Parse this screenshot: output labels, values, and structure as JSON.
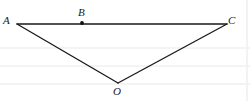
{
  "figure": {
    "kind": "geometry-diagram",
    "background_color": "#ffffff",
    "rule_line_color": "#f0f0f0",
    "stroke_color": "#1a1a1a",
    "points": [
      {
        "id": "A",
        "label": "A",
        "x": 17,
        "y": 24,
        "marked": false,
        "label_x": 3,
        "label_y": 15
      },
      {
        "id": "B",
        "label": "B",
        "x": 82,
        "y": 23,
        "marked": true,
        "label_x": 78,
        "label_y": 7
      },
      {
        "id": "C",
        "label": "C",
        "x": 227,
        "y": 24,
        "marked": false,
        "label_x": 228,
        "label_y": 15
      },
      {
        "id": "O",
        "label": "O",
        "x": 118,
        "y": 83,
        "marked": false,
        "label_x": 113,
        "label_y": 86
      }
    ],
    "segments": [
      {
        "id": "AC",
        "from": "A",
        "to": "C"
      },
      {
        "id": "AO",
        "from": "A",
        "to": "O"
      },
      {
        "id": "OC",
        "from": "O",
        "to": "C"
      }
    ],
    "rule_lines_y": [
      48,
      66,
      84
    ],
    "rule_line_right_x": 247
  }
}
